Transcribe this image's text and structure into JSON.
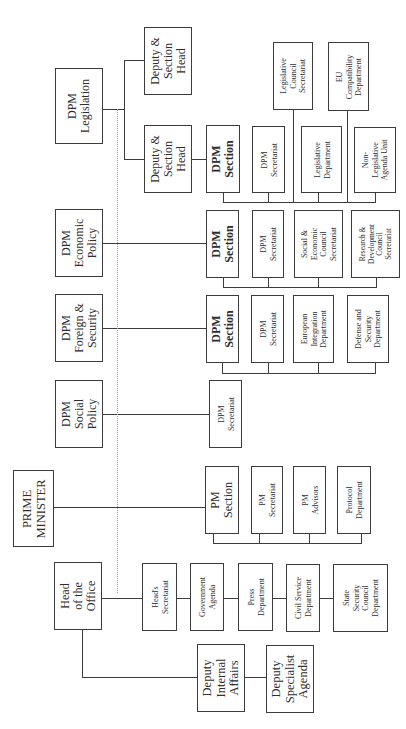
{
  "org": {
    "prime_minister": "PRIME\nMINISTER",
    "pm_units": [
      "PM\nSection",
      "PM\nSecretariat",
      "PM\nAdvisors",
      "Protocol\nDepartment"
    ],
    "head_of_office": {
      "label": "Head\nof the\nOffice",
      "units": [
        "Head's\nSecretariat",
        "Government\nAgenda",
        "Press\nDepartment",
        "Civil Service\nDepartment",
        "State\nSecurity\nCouncil\nDepartment"
      ],
      "deputies": [
        "Deputy\nInternal\nAffairs",
        "Deputy\nSpecialist\nAgenda"
      ]
    },
    "dpm": [
      {
        "label": "DPM\nLegislation",
        "deputies": [
          "Deputy &\nSection\nHead",
          "Deputy &\nSection\nHead"
        ],
        "upper_units": [
          "Legislative\nCouncil\nSecretariat",
          "EU\nCompatibility\nDepartment"
        ],
        "units": [
          "DPM\nSection",
          "DPM\nSecretariat",
          "Legislative\nDepartment",
          "Non-\nLegislative\nAgenda Unit"
        ]
      },
      {
        "label": "DPM\nEconomic\nPolicy",
        "units": [
          "DPM\nSection",
          "DPM\nSecretariat",
          "Social &\nEconomic\nCouncil\nSecretariat",
          "Research &\nDevelopment\nCouncil\nSecretariat"
        ]
      },
      {
        "label": "DPM\nForeign &\nSecurity",
        "units": [
          "DPM\nSection",
          "DPM\nSecretariat",
          "European\nIntegration\nDepartment",
          "Defense and\nSecurity\nDepartment"
        ]
      },
      {
        "label": "DPM\nSocial\nPolicy",
        "units": [
          "DPM\nSecretariat"
        ]
      }
    ]
  }
}
